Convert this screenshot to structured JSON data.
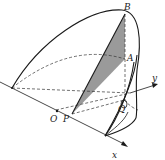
{
  "figure": {
    "type": "3d-geometry",
    "labels": {
      "B": "B",
      "A": "A",
      "O": "O",
      "P": "P",
      "Q": "Q",
      "x_axis": "x",
      "y_axis": "y"
    },
    "colors": {
      "line": "#1a1a1a",
      "shade": "#9a9a9a"
    }
  }
}
